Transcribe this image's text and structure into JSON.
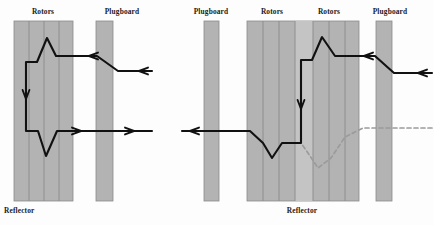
{
  "figure": {
    "background": "#fdfdfd",
    "colors": {
      "block_fill": "#b3b3b3",
      "block_fill_light": "#c4c4c4",
      "block_stroke": "#8a8a8a",
      "path_stroke": "#111111",
      "dashed_stroke": "#9b9b9b",
      "label_color": "#1b1b1b"
    }
  },
  "panels": [
    {
      "id": "left-panel",
      "name": "single-rotor-stage",
      "labels": {
        "rotors": "Rotors",
        "plugboard": "Plugboard",
        "reflector": "Reflector"
      },
      "blocks": {
        "rotors": {
          "x": 14,
          "y": 21,
          "w": 59,
          "h": 180,
          "bands": 4
        },
        "plugboard": {
          "x": 96,
          "y": 21,
          "w": 17,
          "h": 180
        }
      },
      "label_positions": {
        "rotors": {
          "x": 43,
          "y": 14
        },
        "plugboard": {
          "x": 122,
          "y": 14
        },
        "reflector": {
          "x": 4,
          "y": 213
        }
      },
      "paths": {
        "inbound": "M 152,71 L 118,71 L 97,56 L 56,56 L 47,38 L 37,62 L 26,62 L 26,100",
        "outbound": "M 26,100 L 26,131 L 38,131 L 46,156 L 57,131 L 152,131"
      },
      "arrows": [
        {
          "name": "inbound-entry-arrow",
          "x": 139,
          "y": 71,
          "dir": "left"
        },
        {
          "name": "inbound-mid-arrow",
          "x": 89,
          "y": 56,
          "dir": "left"
        },
        {
          "name": "downward-arrow",
          "x": 26,
          "y": 97,
          "dir": "down"
        },
        {
          "name": "outbound-mid-arrow",
          "x": 81,
          "y": 131,
          "dir": "right"
        },
        {
          "name": "outbound-exit-arrow",
          "x": 134,
          "y": 131,
          "dir": "right"
        }
      ]
    },
    {
      "id": "right-panel",
      "name": "stepped-rotor-stage",
      "labels": {
        "plugboard_left": "Plugboard",
        "rotors_left": "Rotors",
        "rotors_right": "Rotors",
        "plugboard_right": "Plugboard",
        "reflector": "Reflector"
      },
      "blocks": {
        "plugboard_left": {
          "x": 204,
          "y": 21,
          "w": 15,
          "h": 180
        },
        "rotors": {
          "x": 247,
          "y": 21,
          "w": 112,
          "h": 180,
          "bands": 7,
          "light_band_index": 3
        },
        "plugboard_right": {
          "x": 376,
          "y": 21,
          "w": 16,
          "h": 180
        }
      },
      "label_positions": {
        "plugboard_left": {
          "x": 198,
          "y": 14
        },
        "rotors_left": {
          "x": 262,
          "y": 14
        },
        "rotors_right": {
          "x": 317,
          "y": 14
        },
        "plugboard_right": {
          "x": 382,
          "y": 14
        },
        "reflector": {
          "x": 292,
          "y": 213
        }
      },
      "paths": {
        "inbound": "M 432,73 L 394,73 L 375,56 L 335,56 L 322,37 L 312,60 L 301,60 L 301,110",
        "outbound": "M 301,110 L 301,143 L 282,143 L 272,158 L 263,143 L 250,131 L 182,131",
        "dashed_reflection": "M 432,128 L 363,128 L 345,137 L 331,158 L 318,168 L 306,150 L 301,143"
      },
      "arrows": [
        {
          "name": "inbound-entry-arrow",
          "x": 418,
          "y": 73,
          "dir": "left"
        },
        {
          "name": "inbound-mid-arrow",
          "x": 364,
          "y": 56,
          "dir": "left"
        },
        {
          "name": "downward-arrow",
          "x": 301,
          "y": 107,
          "dir": "down"
        },
        {
          "name": "outbound-exit-arrow",
          "x": 196,
          "y": 131,
          "dir": "left"
        }
      ]
    }
  ]
}
